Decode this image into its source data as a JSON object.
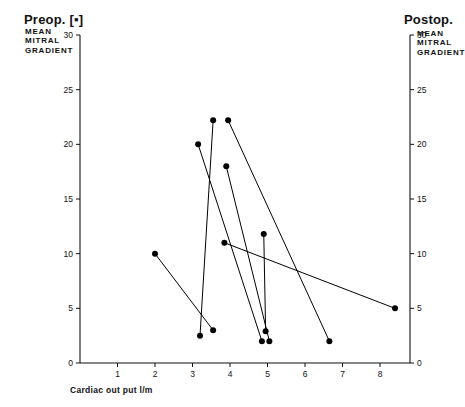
{
  "chart_data": {
    "type": "line",
    "title": "",
    "subtitle": "",
    "xlabel": "Cardiac out put l/m",
    "ylabel_left": "MEAN\nMITRAL\nGRADIENT",
    "ylabel_right": "MEAN\nMITRAL\nGRADIENT",
    "left_axis_title": "Preop. [▪]",
    "right_axis_title": "Postop.",
    "xlim": [
      0,
      8.8
    ],
    "ylim": [
      0,
      30
    ],
    "xticks": [
      0,
      1,
      2,
      3,
      4,
      5,
      6,
      7,
      8
    ],
    "xticklabels": [
      "0",
      "1",
      "2",
      "3",
      "4",
      "5",
      "6",
      "7",
      "8"
    ],
    "yticks": [
      0,
      5,
      10,
      15,
      20,
      25,
      30
    ],
    "yticklabels": [
      "0",
      "5",
      "10",
      "15",
      "20",
      "25",
      "30"
    ],
    "yticks_right": [
      0,
      5,
      10,
      15,
      20,
      25,
      30
    ],
    "yticklabels_right": [
      "0",
      "5",
      "10",
      "15",
      "20",
      "25",
      "30"
    ],
    "grid": false,
    "legend": "none",
    "marker": "filled-circle",
    "marker_color": "#000000",
    "line_color": "#000000",
    "series": [
      {
        "name": "patient-1",
        "preop": {
          "x": 2.0,
          "y": 10.0
        },
        "postop": {
          "x": 3.55,
          "y": 3.0
        }
      },
      {
        "name": "patient-2",
        "preop": {
          "x": 3.15,
          "y": 20.0
        },
        "postop": {
          "x": 4.85,
          "y": 2.0
        }
      },
      {
        "name": "patient-3",
        "preop": {
          "x": 3.55,
          "y": 22.2
        },
        "postop": {
          "x": 3.2,
          "y": 2.5
        }
      },
      {
        "name": "patient-4",
        "preop": {
          "x": 3.95,
          "y": 22.2
        },
        "postop": {
          "x": 6.65,
          "y": 2.0
        }
      },
      {
        "name": "patient-5",
        "preop": {
          "x": 3.9,
          "y": 18.0
        },
        "postop": {
          "x": 5.05,
          "y": 2.0
        }
      },
      {
        "name": "patient-6",
        "preop": {
          "x": 4.9,
          "y": 11.8
        },
        "postop": {
          "x": 4.95,
          "y": 2.9
        }
      },
      {
        "name": "patient-7",
        "preop": {
          "x": 3.85,
          "y": 11.0
        },
        "postop": {
          "x": 8.4,
          "y": 5.0
        }
      }
    ]
  },
  "axes": {
    "left_title": "Preop. [▪]",
    "left_sub": "MEAN\nMITRAL\nGRADIENT",
    "right_title": "Postop.",
    "right_sub": "MEAN\nMITRAL\nGRADIENT",
    "x_title": "Cardiac out put l/m"
  }
}
